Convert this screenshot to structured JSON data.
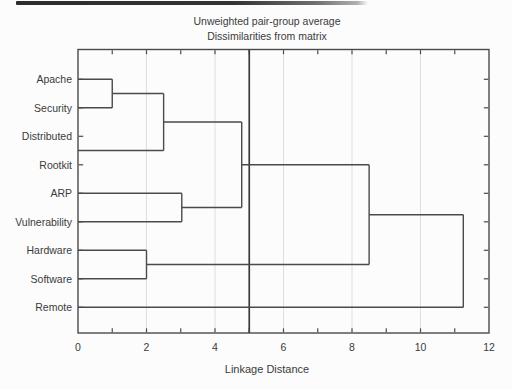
{
  "chart_data": {
    "type": "dendrogram",
    "orientation": "horizontal",
    "title": "Unweighted pair-group average",
    "subtitle": "Dissimilarities from matrix",
    "xlabel": "Linkage Distance",
    "xlim": [
      0,
      12
    ],
    "x_tick_values": [
      0,
      2,
      4,
      6,
      8,
      10,
      12
    ],
    "x_tick_labels": [
      "0",
      "2",
      "4",
      "6",
      "8",
      "10",
      "12"
    ],
    "frame_minor_tick_values": [
      1,
      2,
      3,
      4,
      5,
      6,
      7,
      8,
      9,
      10,
      11
    ],
    "gridline_x_values": [
      2,
      4,
      6,
      8,
      10
    ],
    "reference_line_x": 5,
    "grid_on": true,
    "leaves": [
      "Apache",
      "Security",
      "Distributed",
      "Rootkit",
      "ARP",
      "Vulnerability",
      "Hardware",
      "Software",
      "Remote"
    ],
    "merges": [
      {
        "cluster": [
          "Apache",
          "Security"
        ],
        "distance": 1.0
      },
      {
        "cluster": [
          "Apache",
          "Security",
          "Distributed"
        ],
        "distance": 2.5
      },
      {
        "cluster": [
          "ARP",
          "Vulnerability"
        ],
        "distance": 3.0
      },
      {
        "cluster": [
          "Hardware",
          "Software"
        ],
        "distance": 2.0
      },
      {
        "cluster": [
          "Apache",
          "Security",
          "Distributed",
          "Rootkit",
          "ARP",
          "Vulnerability"
        ],
        "distance": 4.8
      },
      {
        "cluster": [
          "Apache",
          "Security",
          "Distributed",
          "Rootkit",
          "ARP",
          "Vulnerability",
          "Hardware",
          "Software"
        ],
        "distance": 8.5
      },
      {
        "cluster": [
          "Apache",
          "Security",
          "Distributed",
          "Rootkit",
          "ARP",
          "Vulnerability",
          "Hardware",
          "Software",
          "Remote"
        ],
        "distance": 11.25
      }
    ],
    "segments_h": [
      [
        1,
        0,
        1.0
      ],
      [
        2,
        0,
        1.0
      ],
      [
        1.5,
        1.0,
        2.5
      ],
      [
        3.5,
        0,
        2.5
      ],
      [
        2.5,
        2.5,
        4.78
      ],
      [
        5,
        0,
        3.03
      ],
      [
        6,
        0,
        3.03
      ],
      [
        5.5,
        3.03,
        4.78
      ],
      [
        4,
        4.78,
        8.5
      ],
      [
        7,
        0,
        2.0
      ],
      [
        8,
        0,
        2.0
      ],
      [
        7.5,
        2.0,
        8.5
      ],
      [
        5.75,
        8.5,
        11.25
      ],
      [
        9,
        0,
        11.25
      ]
    ],
    "segments_v": [
      [
        1.0,
        1,
        2
      ],
      [
        2.5,
        1.5,
        3.5
      ],
      [
        3.03,
        5,
        6
      ],
      [
        4.78,
        2.5,
        5.5
      ],
      [
        2.0,
        7,
        8
      ],
      [
        8.5,
        4,
        7.5
      ],
      [
        11.25,
        5.75,
        9
      ]
    ],
    "colors": {
      "line": "#4a4a4a",
      "reference_line": "#3a3a3a",
      "grid": "#dedede",
      "text": "#3b3b3b",
      "background": "#fcfcfc"
    }
  }
}
